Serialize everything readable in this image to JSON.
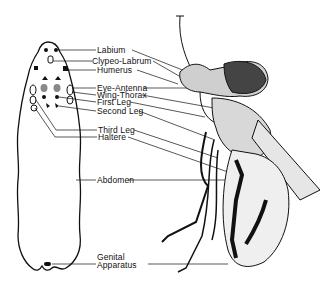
{
  "diagram": {
    "type": "anatomical-fate-map",
    "left_figure": "larval body outline with imaginal discs",
    "right_figure": "adult fly (lateral view)",
    "labels": [
      {
        "id": "labium",
        "text": "Labium"
      },
      {
        "id": "clypeo-labrum",
        "text": "Clypeo-Labrum"
      },
      {
        "id": "humerus",
        "text": "Humerus"
      },
      {
        "id": "eye-antenna",
        "text": "Eye-Antenna"
      },
      {
        "id": "wing-thorax",
        "text": "Wing-Thorax"
      },
      {
        "id": "first-leg",
        "text": "First Leg"
      },
      {
        "id": "second-leg",
        "text": "Second Leg"
      },
      {
        "id": "third-leg",
        "text": "Third Leg"
      },
      {
        "id": "haltere",
        "text": "Haltere"
      },
      {
        "id": "abdomen",
        "text": "Abdomen"
      },
      {
        "id": "genital-apparatus-1",
        "text": "Genital"
      },
      {
        "id": "genital-apparatus-2",
        "text": "Apparatus"
      }
    ]
  }
}
